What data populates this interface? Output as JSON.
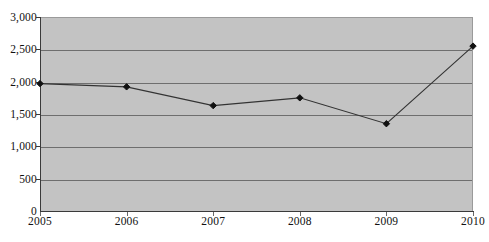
{
  "chart_data": {
    "type": "line",
    "title": "",
    "subtitle": "",
    "xlabel": "",
    "ylabel": "",
    "categories": [
      "2005",
      "2006",
      "2007",
      "2008",
      "2009",
      "2010"
    ],
    "values": [
      1970,
      1920,
      1630,
      1750,
      1350,
      2550
    ],
    "series": [
      {
        "name": "",
        "values": [
          1970,
          1920,
          1630,
          1750,
          1350,
          2550
        ]
      }
    ],
    "ylim": [
      0,
      3000
    ],
    "ytick_values": [
      0,
      500,
      1000,
      1500,
      2000,
      2500,
      3000
    ],
    "ytick_labels": [
      "0",
      "500",
      "1,000",
      "1,500",
      "2,000",
      "2,500",
      "3,000"
    ],
    "xtick_labels": [
      "2005",
      "2006",
      "2007",
      "2008",
      "2009",
      "2010"
    ],
    "grid": "horizontal",
    "legend": "none",
    "marker": "diamond",
    "colors": {
      "plot_background": "#c3c3c3",
      "gridline": "#6e6e6e",
      "axis": "#3a3a3a",
      "series_line": "#333333",
      "marker_fill": "#101010",
      "page_background": "#ffffff",
      "tick_label": "#111111"
    }
  }
}
